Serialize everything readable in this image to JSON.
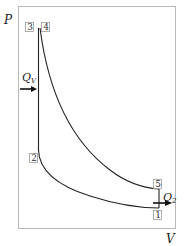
{
  "diagram": {
    "type": "P-V diagram",
    "axes": {
      "y_label": "P",
      "x_label": "V"
    },
    "points": [
      {
        "id": "1",
        "label": "1"
      },
      {
        "id": "2",
        "label": "2"
      },
      {
        "id": "3",
        "label": "3"
      },
      {
        "id": "4",
        "label": "4"
      },
      {
        "id": "5",
        "label": "5"
      }
    ],
    "heat_in": {
      "label": "Q",
      "sub": "V"
    },
    "heat_out": {
      "label": "Q",
      "sub": "2"
    },
    "colors": {
      "frame": "#b8b8b8",
      "curve": "#222222",
      "box": "#999999"
    }
  }
}
